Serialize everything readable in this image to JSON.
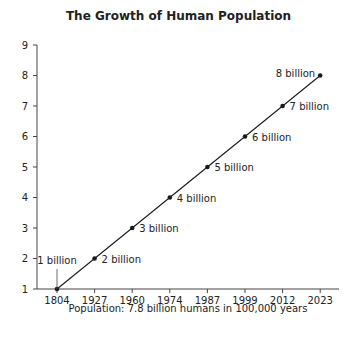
{
  "chart_data": {
    "type": "line",
    "title": "The Growth of Human Population",
    "xlabel": "Population: 7.8 billion humans in 100,000 years",
    "ylabel": "",
    "categories": [
      "1804",
      "1927",
      "1960",
      "1974",
      "1987",
      "1999",
      "2012",
      "2023"
    ],
    "series": [
      {
        "name": "World population (billions)",
        "values": [
          1,
          2,
          3,
          4,
          5,
          6,
          7,
          8
        ],
        "point_labels": [
          "1 billion",
          "2 billion",
          "3 billion",
          "4 billion",
          "5 billion",
          "6 billion",
          "7 billion",
          "8 billion"
        ]
      }
    ],
    "yticks": [
      1,
      2,
      3,
      4,
      5,
      6,
      7,
      8,
      9
    ],
    "ylim": [
      1,
      9
    ],
    "grid": false,
    "legend": "none",
    "colors": {
      "line": "#1a1a1a",
      "text": "#222222",
      "axis": "#444444"
    }
  }
}
